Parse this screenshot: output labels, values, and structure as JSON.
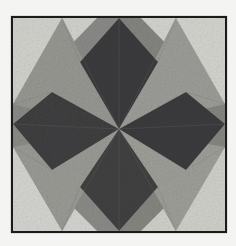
{
  "image": {
    "subject": "quilt-block-eight-pointed-star",
    "rendering": "grayscale-photograph",
    "caption": "",
    "background_color": "#f4f4f2",
    "frame": {
      "border_color": "#1b1b1b",
      "border_width_px": 2,
      "x": 12,
      "y": 17,
      "width": 214,
      "height": 215
    },
    "geometry": {
      "center_x": 119,
      "center_y": 129,
      "mid_top_x": 119,
      "mid_top_y": 17,
      "mid_bottom_y": 232,
      "mid_left_x": 12,
      "mid_right_x": 226,
      "diamond_half_width": 40,
      "diamond_tip_offset": 52
    },
    "palette": {
      "dark_charcoal": "#343436",
      "dark_charcoal_alt": "#3c3c3e",
      "dark_charcoal_deep": "#2c2c2f",
      "medium_gray": "#8e8e8c",
      "medium_gray_alt": "#9a9a97",
      "medium_gray_light": "#a4a4a1",
      "light_cream": "#d9d9d4",
      "light_cream_bright": "#e3e3de",
      "background_gray": "#8a8a88",
      "background_gray_dark": "#7e7e7c",
      "seam_line": "#6d6d6b"
    },
    "patches": [
      {
        "id": "bg-top-left",
        "name": "background-top-left",
        "tone": "background gray",
        "fill": "#8a8a88"
      },
      {
        "id": "bg-top-right",
        "name": "background-top-right",
        "tone": "background gray",
        "fill": "#84847f"
      },
      {
        "id": "bg-bottom-left",
        "name": "background-bottom-left",
        "tone": "background gray",
        "fill": "#8b8b87"
      },
      {
        "id": "bg-bottom-right",
        "name": "background-bottom-right",
        "tone": "background gray",
        "fill": "#86867f"
      },
      {
        "id": "corner-tl",
        "name": "corner-triangle-top-left",
        "tone": "light cream",
        "fill": "#dcdcd6"
      },
      {
        "id": "corner-tr",
        "name": "corner-triangle-top-right",
        "tone": "light cream",
        "fill": "#dedeD8"
      },
      {
        "id": "corner-bl",
        "name": "corner-triangle-bottom-left",
        "tone": "light cream",
        "fill": "#dededa"
      },
      {
        "id": "corner-br",
        "name": "corner-triangle-bottom-right",
        "tone": "light cream",
        "fill": "#dadad4"
      },
      {
        "id": "star-n",
        "name": "star-point-north",
        "tone": "dark charcoal",
        "fill": "#343436"
      },
      {
        "id": "star-s",
        "name": "star-point-south",
        "tone": "dark charcoal",
        "fill": "#3a3a3b"
      },
      {
        "id": "star-w",
        "name": "star-point-west",
        "tone": "dark charcoal",
        "fill": "#383839"
      },
      {
        "id": "star-e",
        "name": "star-point-east",
        "tone": "dark charcoal",
        "fill": "#343437"
      },
      {
        "id": "star-nw",
        "name": "star-point-northwest",
        "tone": "medium gray",
        "fill": "#9a9a95"
      },
      {
        "id": "star-ne",
        "name": "star-point-northeast",
        "tone": "medium gray",
        "fill": "#a0a09b"
      },
      {
        "id": "star-sw",
        "name": "star-point-southwest",
        "tone": "medium gray",
        "fill": "#9d9d98"
      },
      {
        "id": "star-se",
        "name": "star-point-southeast",
        "tone": "medium gray",
        "fill": "#a2a29c"
      }
    ]
  }
}
